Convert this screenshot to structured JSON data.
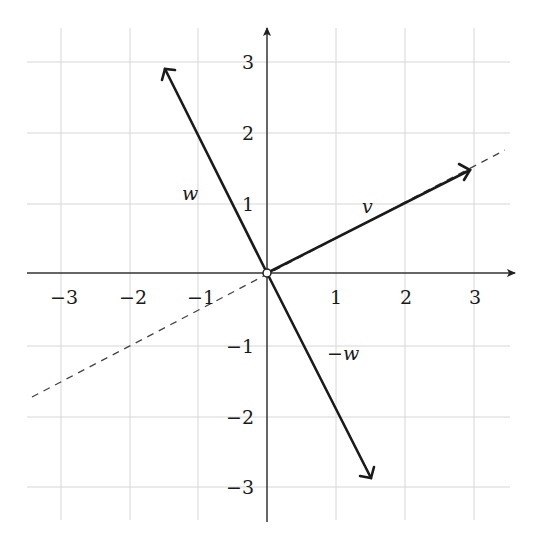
{
  "diagram": {
    "type": "vector-plot",
    "axes": {
      "x_range": [
        -3.5,
        3.5
      ],
      "y_range": [
        -3.5,
        3.5
      ],
      "x_ticks": [
        "−3",
        "−2",
        "−1",
        "1",
        "2",
        "3"
      ],
      "y_ticks": [
        "3",
        "2",
        "1",
        "−1",
        "−2",
        "−3"
      ],
      "grid": true
    },
    "vectors": [
      {
        "name": "v",
        "label": "v",
        "from": [
          0,
          0
        ],
        "to": [
          3,
          1.5
        ]
      },
      {
        "name": "w",
        "label": "w",
        "from": [
          0,
          0
        ],
        "to": [
          -1.5,
          3
        ]
      },
      {
        "name": "neg-w",
        "label": "−w",
        "from": [
          0,
          0
        ],
        "to": [
          1.5,
          -3
        ]
      }
    ],
    "line": {
      "name": "span-of-v",
      "style": "dashed",
      "slope": 0.5
    },
    "origin_marker": "open-circle",
    "colors": {
      "vector": "#1a1a1a",
      "grid": "#d6d6d6",
      "axis": "#333333",
      "dashed": "#444444"
    }
  }
}
